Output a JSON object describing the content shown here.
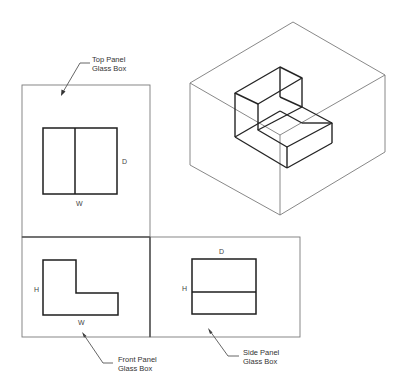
{
  "figure": {
    "colors": {
      "object_line": "#1e1e1e",
      "glass_box_line": "#7a7a7a",
      "text": "#333333",
      "background": "#ffffff"
    }
  },
  "callouts": {
    "top_panel": {
      "line1": "Top Panel",
      "line2": "Glass Box"
    },
    "front_panel": {
      "line1": "Front Panel",
      "line2": "Glass Box"
    },
    "side_panel": {
      "line1": "Side Panel",
      "line2": "Glass Box"
    }
  },
  "views": {
    "top": {
      "name": "Top View",
      "width_label": "W",
      "depth_label": "D"
    },
    "front": {
      "name": "Front View",
      "width_label": "W",
      "height_label": "H"
    },
    "side": {
      "name": "Side View",
      "depth_label": "D",
      "height_label": "H"
    }
  },
  "pictorial": {
    "name": "Isometric glass box with L-shaped object"
  }
}
